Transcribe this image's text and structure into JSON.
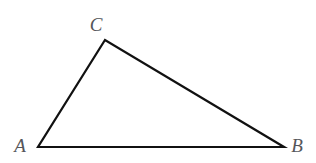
{
  "figure": {
    "name": "triangle-abc",
    "background_color": "#ffffff",
    "stroke_color": "#111111",
    "stroke_width": 2.2,
    "label_color": "#55565a",
    "canvas": {
      "width": 316,
      "height": 163
    }
  },
  "labels": {
    "a": "A",
    "b": "B",
    "c": "C"
  },
  "chart_data": {
    "type": "diagram",
    "shape": "triangle",
    "title": "",
    "xlabel": "",
    "ylabel": "",
    "grid": false,
    "legend": null,
    "vertices": [
      {
        "label": "A",
        "x": 38,
        "y": 147
      },
      {
        "label": "B",
        "x": 284,
        "y": 147
      },
      {
        "label": "C",
        "x": 105,
        "y": 40
      }
    ],
    "edges": [
      {
        "from": "A",
        "to": "B"
      },
      {
        "from": "A",
        "to": "C"
      },
      {
        "from": "C",
        "to": "B"
      }
    ],
    "label_positions": [
      {
        "label": "A",
        "x": 20,
        "y": 145
      },
      {
        "label": "B",
        "x": 297,
        "y": 145
      },
      {
        "label": "C",
        "x": 96,
        "y": 24
      }
    ]
  }
}
